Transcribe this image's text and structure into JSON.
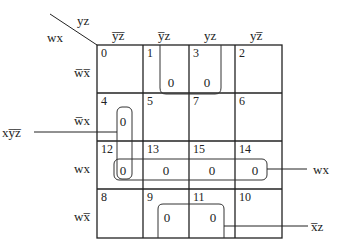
{
  "kmap": {
    "corner": {
      "col_var": "yz",
      "row_var": "wx"
    },
    "col_headers": [
      "y̅z̅",
      "y̅z",
      "yz",
      "yz̅"
    ],
    "row_headers": [
      "w̅x̅",
      "w̅x",
      "wx",
      "wx̅"
    ],
    "cells": [
      [
        {
          "index": "0",
          "value": ""
        },
        {
          "index": "1",
          "value": "0"
        },
        {
          "index": "3",
          "value": "0"
        },
        {
          "index": "2",
          "value": ""
        }
      ],
      [
        {
          "index": "4",
          "value": "0"
        },
        {
          "index": "5",
          "value": ""
        },
        {
          "index": "7",
          "value": ""
        },
        {
          "index": "6",
          "value": ""
        }
      ],
      [
        {
          "index": "12",
          "value": "0"
        },
        {
          "index": "13",
          "value": "0"
        },
        {
          "index": "15",
          "value": "0"
        },
        {
          "index": "14",
          "value": "0"
        }
      ],
      [
        {
          "index": "8",
          "value": ""
        },
        {
          "index": "9",
          "value": "0"
        },
        {
          "index": "11",
          "value": "0"
        },
        {
          "index": "10",
          "value": ""
        }
      ]
    ],
    "groups": [
      {
        "label": "xy̅z̅",
        "cells": [
          "4",
          "12"
        ],
        "side": "left"
      },
      {
        "label": "wx",
        "cells": [
          "12",
          "13",
          "15",
          "14"
        ],
        "side": "right"
      },
      {
        "label": "x̅z",
        "cells": [
          "9",
          "11"
        ],
        "side": "right"
      },
      {
        "label": "",
        "cells": [
          "1",
          "3"
        ],
        "side": "none"
      }
    ]
  }
}
